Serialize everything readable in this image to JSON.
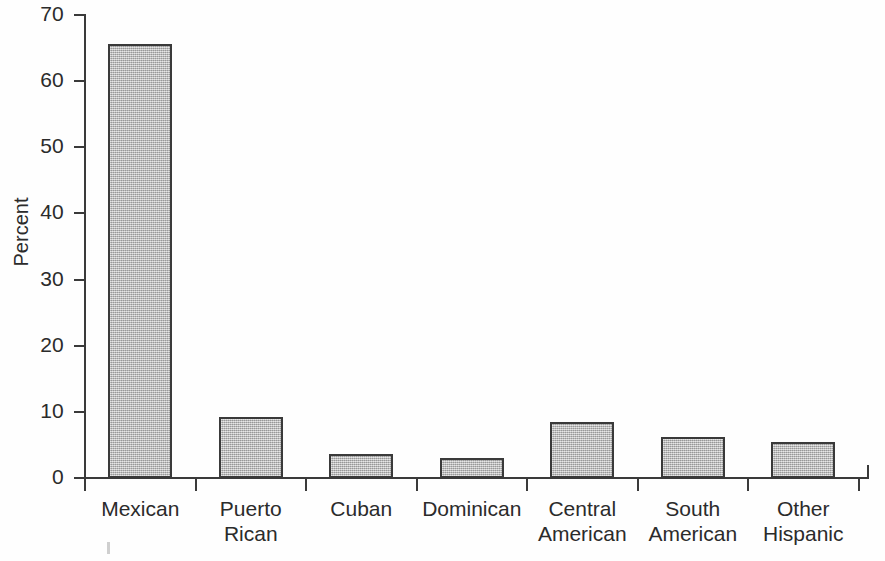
{
  "chart_data": {
    "type": "bar",
    "title": "",
    "xlabel": "",
    "ylabel": "Percent",
    "ylim": [
      0,
      70
    ],
    "ytick_labels": [
      "70",
      "60",
      "50",
      "40",
      "30",
      "20",
      "10",
      "0"
    ],
    "ytick_values": [
      70,
      60,
      50,
      40,
      30,
      20,
      10,
      0
    ],
    "grid": false,
    "legend": "none",
    "categories": [
      "Mexican",
      "Puerto\nRican",
      "Cuban",
      "Dominican",
      "Central\nAmerican",
      "South\nAmerican",
      "Other\nHispanic"
    ],
    "values": [
      65.6,
      9.2,
      3.6,
      3.0,
      8.5,
      6.2,
      5.4
    ],
    "bar_fill_color": "#b4b4b4",
    "bar_edge_color": "#3a3a3a",
    "axis_color": "#3a3a3a",
    "background_color": "#ffffff"
  },
  "axis": {
    "y_title": "Percent"
  }
}
